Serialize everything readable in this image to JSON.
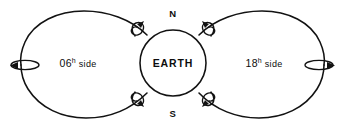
{
  "figure": {
    "background_color": "#ffffff",
    "line_color": "#121212",
    "width": 343,
    "height": 131
  },
  "central_body": {
    "label": "EARTH",
    "north_pole_label": "N",
    "south_pole_label": "S",
    "center_x": 173,
    "center_y": 63,
    "radius": 33
  },
  "lobes": [
    {
      "name": "left-lobe",
      "hour": "06",
      "hour_superscript": "h",
      "word": "side",
      "full_label": "06h side",
      "side": "left"
    },
    {
      "name": "right-lobe",
      "hour": "18",
      "hour_superscript": "h",
      "word": "side",
      "full_label": "18h side",
      "side": "right"
    }
  ],
  "circulation_markers": [
    {
      "name": "curl-arrow-top-left",
      "x": 140,
      "y": 28
    },
    {
      "name": "curl-arrow-top-right",
      "x": 203,
      "y": 28
    },
    {
      "name": "curl-arrow-bottom-left",
      "x": 140,
      "y": 99
    },
    {
      "name": "curl-arrow-bottom-right",
      "x": 203,
      "y": 99
    },
    {
      "name": "curl-arrow-far-left",
      "x": 25,
      "y": 65
    },
    {
      "name": "curl-arrow-far-right",
      "x": 318,
      "y": 65
    }
  ]
}
